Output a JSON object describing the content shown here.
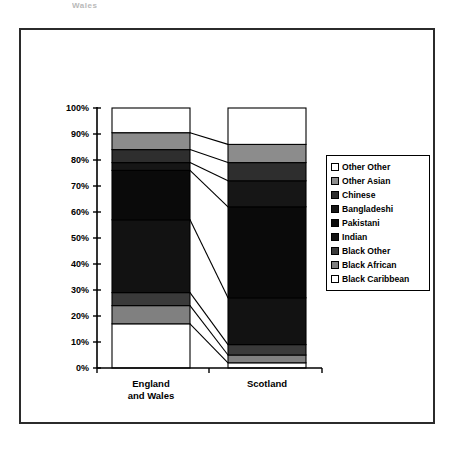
{
  "page": {
    "cropped_header_fragment": "Wales"
  },
  "chart_data": {
    "type": "bar",
    "stacked": true,
    "percent_stacked": true,
    "title": "",
    "xlabel": "",
    "ylabel": "",
    "ylim": [
      0,
      100
    ],
    "ytick_labels": [
      "0%",
      "10%",
      "20%",
      "30%",
      "40%",
      "50%",
      "60%",
      "70%",
      "80%",
      "90%",
      "100%"
    ],
    "ytick_values": [
      0,
      10,
      20,
      30,
      40,
      50,
      60,
      70,
      80,
      90,
      100
    ],
    "grid": false,
    "legend_position": "right",
    "categories": [
      "England and Wales",
      "Scotland"
    ],
    "category_label_lines": [
      [
        "England",
        "and Wales"
      ],
      [
        "Scotland"
      ]
    ],
    "series": [
      {
        "name": "Black Caribbean",
        "color": "#ffffff",
        "values": [
          17.0,
          2.0
        ]
      },
      {
        "name": "Black African",
        "color": "#808080",
        "values": [
          7.0,
          3.0
        ]
      },
      {
        "name": "Black Other",
        "color": "#3a3a3a",
        "values": [
          5.0,
          4.0
        ]
      },
      {
        "name": "Indian",
        "color": "#121212",
        "values": [
          28.0,
          18.0
        ]
      },
      {
        "name": "Pakistani",
        "color": "#0a0a0a",
        "values": [
          19.0,
          35.0
        ]
      },
      {
        "name": "Bangladeshi",
        "color": "#161616",
        "values": [
          3.0,
          10.0
        ]
      },
      {
        "name": "Chinese",
        "color": "#2e2e2e",
        "values": [
          5.0,
          7.0
        ]
      },
      {
        "name": "Other Asian",
        "color": "#8c8c8c",
        "values": [
          6.5,
          7.0
        ]
      },
      {
        "name": "Other Other",
        "color": "#ffffff",
        "values": [
          9.5,
          14.0
        ]
      }
    ],
    "legend_entries_top_to_bottom": [
      {
        "label": "Other Other",
        "color": "#ffffff"
      },
      {
        "label": "Other Asian",
        "color": "#8c8c8c"
      },
      {
        "label": "Chinese",
        "color": "#2e2e2e"
      },
      {
        "label": "Bangladeshi",
        "color": "#161616"
      },
      {
        "label": "Pakistani",
        "color": "#0a0a0a"
      },
      {
        "label": "Indian",
        "color": "#121212"
      },
      {
        "label": "Black Other",
        "color": "#3a3a3a"
      },
      {
        "label": "Black African",
        "color": "#808080"
      },
      {
        "label": "Black Caribbean",
        "color": "#ffffff"
      }
    ],
    "cumulative_boundaries": {
      "England and Wales": [
        0,
        17,
        24,
        29,
        57,
        76,
        79,
        84,
        90.5,
        100
      ],
      "Scotland": [
        0,
        2,
        5,
        9,
        27,
        62,
        72,
        79,
        86,
        100
      ]
    },
    "connector_lines": true,
    "axis_color": "#000000",
    "frame_color": "#2b2b2b"
  }
}
